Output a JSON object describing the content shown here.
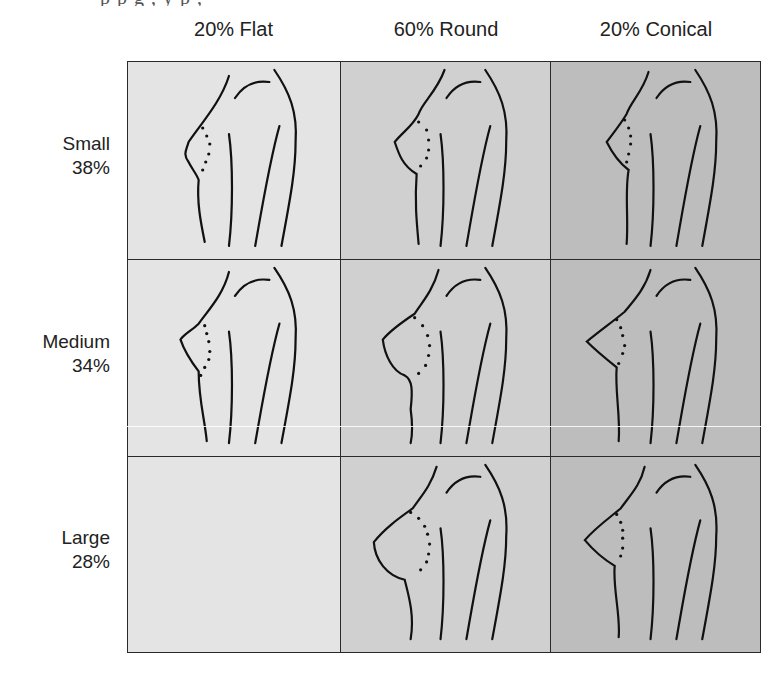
{
  "caption_fragment": "p             p          g ,   y  p ,",
  "columns": [
    {
      "label": "20% Flat",
      "shape": "flat",
      "bg": "#e4e4e4"
    },
    {
      "label": "60% Round",
      "shape": "round",
      "bg": "#d0d0d0"
    },
    {
      "label": "20% Conical",
      "shape": "conical",
      "bg": "#bdbdbd"
    }
  ],
  "rows": [
    {
      "name": "Small",
      "pct": "38%",
      "size": "small"
    },
    {
      "name": "Medium",
      "pct": "34%",
      "size": "medium"
    },
    {
      "name": "Large",
      "pct": "28%",
      "size": "large"
    }
  ],
  "cells": [
    [
      {
        "shape": "flat",
        "size": "small",
        "empty": false
      },
      {
        "shape": "round",
        "size": "small",
        "empty": false
      },
      {
        "shape": "conical",
        "size": "small",
        "empty": false
      }
    ],
    [
      {
        "shape": "flat",
        "size": "medium",
        "empty": false
      },
      {
        "shape": "round",
        "size": "medium",
        "empty": false
      },
      {
        "shape": "conical",
        "size": "medium",
        "empty": false
      }
    ],
    [
      {
        "shape": "flat",
        "size": "large",
        "empty": true
      },
      {
        "shape": "round",
        "size": "large",
        "empty": false
      },
      {
        "shape": "conical",
        "size": "large",
        "empty": false
      }
    ]
  ],
  "colors": {
    "line": "#111111",
    "border": "#2a2a2a",
    "flat_bg": "#e4e4e4",
    "round_bg": "#d0d0d0",
    "conical_bg": "#bdbdbd"
  }
}
